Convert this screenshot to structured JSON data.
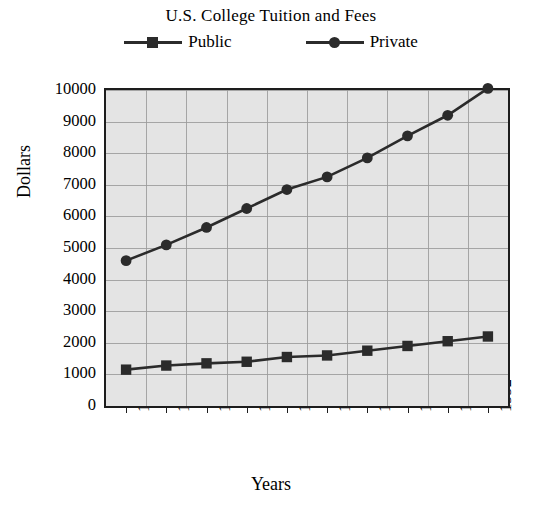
{
  "chart_data": {
    "type": "line",
    "title": "U.S. College Tuition and Fees",
    "xlabel": "Years",
    "ylabel": "Dollars",
    "categories": [
      "1983",
      "1984",
      "1985",
      "1986",
      "1987",
      "1988",
      "1989",
      "1990",
      "1991",
      "1992"
    ],
    "series": [
      {
        "name": "Public",
        "marker": "square",
        "color": "#2b2b2b",
        "values": [
          1150,
          1280,
          1350,
          1400,
          1550,
          1600,
          1750,
          1900,
          2050,
          2200
        ]
      },
      {
        "name": "Private",
        "marker": "circle",
        "color": "#2b2b2b",
        "values": [
          4600,
          5100,
          5650,
          6250,
          6850,
          7250,
          7850,
          8550,
          9200,
          10050
        ]
      }
    ],
    "ylim": [
      0,
      10000
    ],
    "yticks": [
      "10000",
      "9000",
      "8000",
      "7000",
      "6000",
      "5000",
      "4000",
      "3000",
      "2000",
      "1000",
      "0"
    ],
    "ytick_values": [
      10000,
      9000,
      8000,
      7000,
      6000,
      5000,
      4000,
      3000,
      2000,
      1000,
      0
    ],
    "grid": true,
    "legend_position": "top",
    "plot_background": "#e4e4e4",
    "gridline_color": "#9a9a9a",
    "axis_color": "#1d1d1d"
  },
  "legend": {
    "entries": [
      {
        "label": "Public"
      },
      {
        "label": "Private"
      }
    ]
  }
}
